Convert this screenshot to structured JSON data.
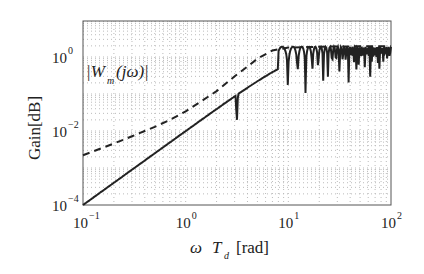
{
  "chart_data": {
    "type": "line",
    "title": "",
    "xlabel": "ω T_d [rad]",
    "ylabel": "Gain[dB]",
    "xscale": "log",
    "yscale": "log",
    "xlim": [
      0.1,
      100
    ],
    "ylim": [
      0.0001,
      9.3
    ],
    "grid": true,
    "x_ticks": [
      "10^-1",
      "10^0",
      "10^1",
      "10^2"
    ],
    "y_ticks": [
      "10^-4",
      "10^-2",
      "10^0"
    ],
    "annotation": "|W_m(jω)|",
    "series": [
      {
        "name": "|W_m(jω)|",
        "style": "dashed",
        "color": "#222222",
        "x": [
          0.1,
          0.2,
          0.3,
          0.5,
          0.7,
          1.0,
          1.5,
          2.0,
          3.0,
          4.0,
          5.0,
          7.0,
          10.0,
          20.0,
          50.0,
          100.0
        ],
        "values": [
          0.0022,
          0.0046,
          0.0072,
          0.013,
          0.02,
          0.034,
          0.07,
          0.12,
          0.3,
          0.55,
          0.9,
          1.5,
          1.8,
          1.9,
          1.95,
          1.95
        ]
      },
      {
        "name": "solid",
        "style": "solid",
        "color": "#222222",
        "x": [
          0.1,
          0.2,
          0.5,
          1.0,
          2.0,
          3.0,
          4.0,
          5.0,
          6.0,
          7.0,
          8.0,
          8.7,
          10.0,
          11.3,
          12.4,
          13.6,
          15.9,
          20.0,
          50.0,
          100.0
        ],
        "values": [
          0.0001,
          0.0004,
          0.0025,
          0.01,
          0.05,
          0.17,
          0.5,
          1.2,
          1.9,
          1.5,
          0.5,
          0.003,
          1.6,
          0.004,
          1.8,
          0.0025,
          0.005,
          1.9,
          1.9,
          1.9
        ],
        "notch_note": "periodic notches from ~8.7 with ~2.4 spacing up to 100"
      }
    ]
  }
}
